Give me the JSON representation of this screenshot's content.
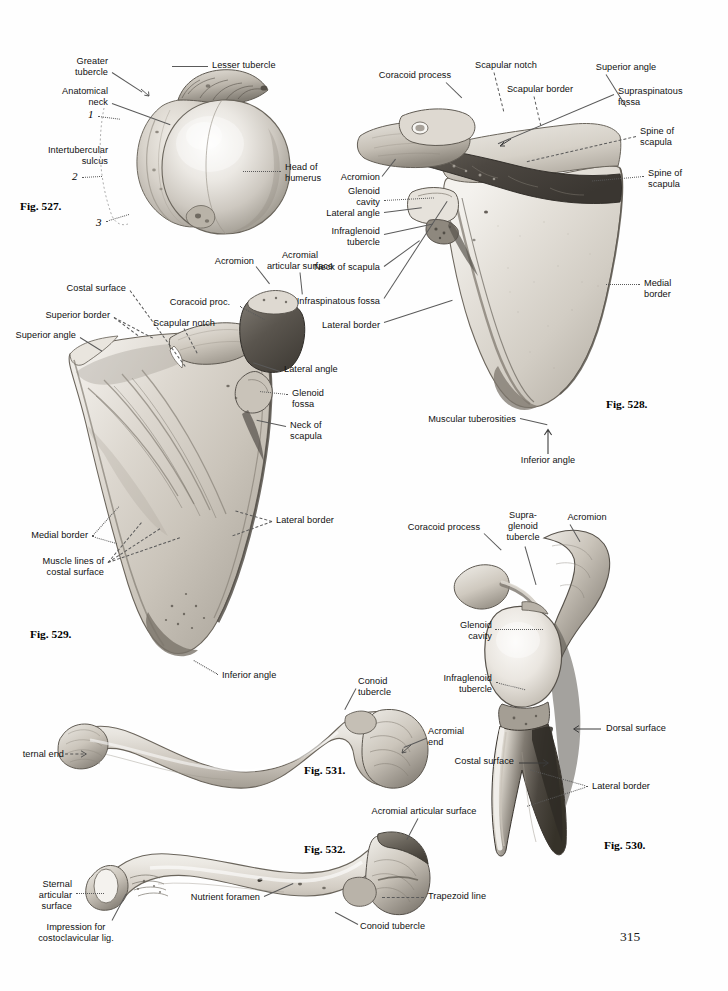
{
  "page": {
    "number": "315",
    "background": "#fefefe",
    "text_color": "#111111"
  },
  "figures": [
    {
      "id": "fig-527",
      "caption": "Fig. 527.",
      "subject": "Proximal end of humerus, superior view",
      "labels": [
        "Greater\ntubercle",
        "Lesser tubercle",
        "Anatomical\nneck",
        "Intertubercular\nsulcus",
        "Head of\nhumerus"
      ],
      "numbered_markers": [
        "1",
        "2",
        "3"
      ]
    },
    {
      "id": "fig-528",
      "caption": "Fig. 528.",
      "subject": "Scapula, dorsal surface",
      "labels": [
        "Coracoid process",
        "Scapular notch",
        "Scapular border",
        "Superior angle",
        "Supraspinatous\nfossa",
        "Spine of\nscapula",
        "Spine of\nscapula",
        "Acromion",
        "Glenoid\ncavity",
        "Lateral angle",
        "Infraglenoid\ntubercle",
        "Neck of scapula",
        "Infraspinatous fossa",
        "Lateral border",
        "Medial\nborder",
        "Muscular tuberosities",
        "Inferior angle"
      ]
    },
    {
      "id": "fig-529",
      "caption": "Fig. 529.",
      "subject": "Scapula, costal surface",
      "labels": [
        "Acromion",
        "Acromial\narticular surface",
        "Costal surface",
        "Coracoid proc.",
        "Superior border",
        "Scapular notch",
        "Superior angle",
        "Lateral angle",
        "Glenoid\nfossa",
        "Neck of\nscapula",
        "Medial border",
        "Muscle lines of\ncostal surface",
        "Lateral border",
        "Inferior angle"
      ]
    },
    {
      "id": "fig-530",
      "caption": "Fig. 530.",
      "subject": "Scapula, lateral view",
      "labels": [
        "Coracoid process",
        "Supra-\nglenoid\ntubercle",
        "Acromion",
        "Glenoid\ncavity",
        "Infraglenoid\ntubercle",
        "Dorsal surface",
        "Costal surface",
        "Lateral border"
      ]
    },
    {
      "id": "fig-531",
      "caption": "Fig. 531.",
      "subject": "Clavicle, superior surface",
      "labels": [
        "ternal end",
        "Conoid\ntubercle",
        "Acromial\nend"
      ]
    },
    {
      "id": "fig-532",
      "caption": "Fig. 532.",
      "subject": "Clavicle, inferior surface",
      "labels": [
        "Acromial articular surface",
        "Trapezoid line",
        "Conoid tubercle",
        "Nutrient foramen",
        "Sternal\narticular\nsurface",
        "Impression for\ncostoclavicular lig."
      ]
    }
  ],
  "fig527": {
    "caption": "Fig. 527.",
    "greater_tubercle": "Greater\ntubercle",
    "lesser_tubercle": "Lesser tubercle",
    "anatomical_neck": "Anatomical\nneck",
    "intertubercular_sulcus": "Intertubercular\nsulcus",
    "head_of_humerus": "Head of\nhumerus",
    "marker_1": "1",
    "marker_2": "2",
    "marker_3": "3"
  },
  "fig528": {
    "caption": "Fig. 528.",
    "coracoid_process": "Coracoid process",
    "scapular_notch": "Scapular notch",
    "scapular_border": "Scapular border",
    "superior_angle": "Superior angle",
    "supraspinatous_fossa": "Supraspinatous\nfossa",
    "spine_of_scapula_upper": "Spine of\nscapula",
    "spine_of_scapula_lower": "Spine of\nscapula",
    "acromion": "Acromion",
    "glenoid_cavity": "Glenoid\ncavity",
    "lateral_angle": "Lateral angle",
    "infraglenoid_tubercle": "Infraglenoid\ntubercle",
    "neck_of_scapula": "Neck of scapula",
    "infraspinatous_fossa": "Infraspinatous fossa",
    "lateral_border": "Lateral border",
    "medial_border": "Medial\nborder",
    "muscular_tuberosities": "Muscular tuberosities",
    "inferior_angle": "Inferior angle"
  },
  "fig529": {
    "caption": "Fig. 529.",
    "acromion": "Acromion",
    "acromial_articular_surface": "Acromial\narticular surface",
    "costal_surface": "Costal surface",
    "coracoid_proc": "Coracoid proc.",
    "superior_border": "Superior border",
    "scapular_notch": "Scapular notch",
    "superior_angle": "Superior angle",
    "lateral_angle": "Lateral angle",
    "glenoid_fossa": "Glenoid\nfossa",
    "neck_of_scapula": "Neck of\nscapula",
    "medial_border": "Medial border",
    "muscle_lines": "Muscle lines of\ncostal surface",
    "lateral_border": "Lateral border",
    "inferior_angle": "Inferior angle"
  },
  "fig530": {
    "caption": "Fig. 530.",
    "coracoid_process": "Coracoid process",
    "supraglenoid_tubercle": "Supra-\nglenoid\ntubercle",
    "acromion": "Acromion",
    "glenoid_cavity": "Glenoid\ncavity",
    "infraglenoid_tubercle": "Infraglenoid\ntubercle",
    "dorsal_surface": "Dorsal surface",
    "costal_surface": "Costal surface",
    "lateral_border": "Lateral border"
  },
  "fig531": {
    "caption": "Fig. 531.",
    "sternal_end": "ternal end",
    "conoid_tubercle": "Conoid\ntubercle",
    "acromial_end": "Acromial\nend"
  },
  "fig532": {
    "caption": "Fig. 532.",
    "acromial_articular_surface": "Acromial articular surface",
    "trapezoid_line": "Trapezoid line",
    "conoid_tubercle": "Conoid tubercle",
    "nutrient_foramen": "Nutrient foramen",
    "sternal_articular_surface": "Sternal\narticular\nsurface",
    "impression_costoclavicular": "Impression for\ncostoclavicular lig."
  }
}
